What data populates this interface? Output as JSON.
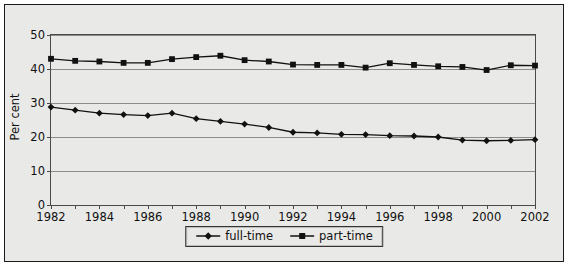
{
  "chart_data": {
    "type": "line",
    "title": "",
    "xlabel": "",
    "ylabel": "Per cent",
    "xlim": [
      1982,
      2002
    ],
    "ylim": [
      0,
      50
    ],
    "yticks": [
      0,
      10,
      20,
      30,
      40,
      50
    ],
    "ytick_labels": [
      "0",
      "10",
      "20",
      "30",
      "40",
      "50"
    ],
    "xticks": [
      1982,
      1984,
      1986,
      1988,
      1990,
      1992,
      1994,
      1996,
      1998,
      2000,
      2002
    ],
    "xtick_labels": [
      "1982",
      "1984",
      "1986",
      "1988",
      "1990",
      "1992",
      "1994",
      "1996",
      "1998",
      "2000",
      "2002"
    ],
    "x": [
      1982,
      1983,
      1984,
      1985,
      1986,
      1987,
      1988,
      1989,
      1990,
      1991,
      1992,
      1993,
      1994,
      1995,
      1996,
      1997,
      1998,
      1999,
      2000,
      2001,
      2002
    ],
    "grid": "horizontal",
    "legend_position": "bottom-center",
    "series": [
      {
        "name": "full-time",
        "marker": "diamond",
        "color": "#111111",
        "values": [
          28.8,
          27.9,
          27.0,
          26.6,
          26.3,
          27.0,
          25.4,
          24.6,
          23.8,
          22.8,
          21.4,
          21.2,
          20.8,
          20.7,
          20.4,
          20.3,
          20.0,
          19.1,
          18.9,
          19.0,
          19.2
        ]
      },
      {
        "name": "part-time",
        "marker": "square",
        "color": "#111111",
        "values": [
          43.0,
          42.4,
          42.2,
          41.8,
          41.8,
          42.9,
          43.5,
          43.9,
          42.6,
          42.2,
          41.3,
          41.2,
          41.2,
          40.4,
          41.7,
          41.2,
          40.8,
          40.6,
          39.7,
          41.1,
          41.0
        ]
      }
    ]
  },
  "legend": {
    "items": [
      {
        "label": "full-time"
      },
      {
        "label": "part-time"
      }
    ]
  }
}
